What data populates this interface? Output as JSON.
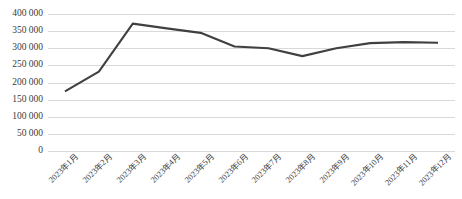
{
  "chart_data": {
    "type": "line",
    "title": "",
    "xlabel": "",
    "ylabel": "",
    "categories": [
      "2023年1月",
      "2023年2月",
      "2023年3月",
      "2023年4月",
      "2023年5月",
      "2023年6月",
      "2023年7月",
      "2023年8月",
      "2023年9月",
      "2023年10月",
      "2023年11月",
      "2023年12月"
    ],
    "values": [
      174000,
      232000,
      372000,
      358000,
      345000,
      305000,
      300000,
      277000,
      300000,
      315000,
      318000,
      316000
    ],
    "ylim": [
      0,
      400000
    ],
    "ytick_values": [
      0,
      50000,
      100000,
      150000,
      200000,
      250000,
      300000,
      350000,
      400000
    ],
    "ytick_labels": [
      "0",
      "50 000",
      "100 000",
      "150 000",
      "200 000",
      "250 000",
      "300 000",
      "350 000",
      "400 000"
    ],
    "grid": true,
    "grid_axis": "y",
    "legend": false,
    "legend_position": "none",
    "series_color": "#404040",
    "gridline_color": "#d9d9d9",
    "background_color": "#ffffff",
    "line_width": 2.1,
    "markers": false,
    "xtick_rotation": -45
  },
  "caption": {
    "ghost_text": ""
  }
}
